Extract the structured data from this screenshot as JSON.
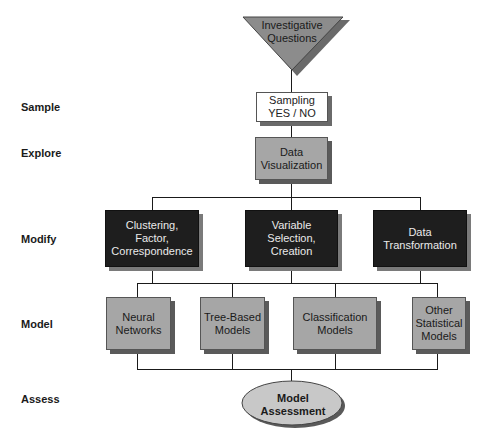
{
  "stages": [
    {
      "label": "Sample"
    },
    {
      "label": "Explore"
    },
    {
      "label": "Modify"
    },
    {
      "label": "Model"
    },
    {
      "label": "Assess"
    }
  ],
  "start": {
    "label": "Investigative\nQuestions",
    "shape": "inverted-triangle",
    "color": "#8c8c8c"
  },
  "sample": {
    "label": "Sampling\nYES / NO",
    "color": "#ffffff"
  },
  "explore": {
    "label": "Data\nVisualization",
    "color": "#a6a6a6"
  },
  "modify": [
    {
      "label": "Clustering,\nFactor,\nCorrespondence"
    },
    {
      "label": "Variable\nSelection,\nCreation"
    },
    {
      "label": "Data\nTransformation"
    }
  ],
  "model": [
    {
      "label": "Neural\nNetworks"
    },
    {
      "label": "Tree-Based\nModels"
    },
    {
      "label": "Classification\nModels"
    },
    {
      "label": "Other\nStatistical\nModels"
    }
  ],
  "assess": {
    "label": "Model\nAssessment",
    "shape": "ellipse",
    "color": "#c8c8c8"
  },
  "colors": {
    "modify_fill": "#1e1e1e",
    "model_fill": "#a6a6a6",
    "line": "#1a1a1a"
  }
}
